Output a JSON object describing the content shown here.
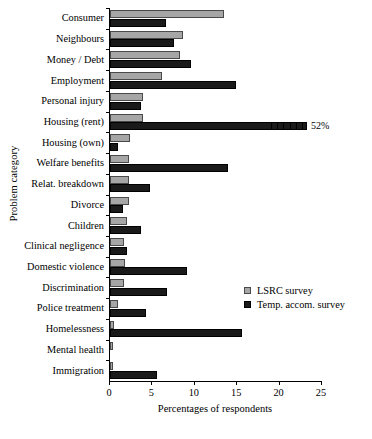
{
  "chart_data": {
    "type": "bar",
    "orientation": "horizontal",
    "title": "",
    "xlabel": "Percentages of respondents",
    "ylabel": "Problem category",
    "xlim": [
      0,
      25
    ],
    "xticks": [
      0,
      5,
      10,
      15,
      20,
      25
    ],
    "xtick_labels": [
      "0",
      "5",
      "10",
      "15",
      "20",
      "25"
    ],
    "grid": false,
    "legend_position": "right-middle",
    "categories": [
      "Consumer",
      "Neighbours",
      "Money / Debt",
      "Employment",
      "Personal injury",
      "Housing (rent)",
      "Housing (own)",
      "Welfare benefits",
      "Relat. breakdown",
      "Divorce",
      "Children",
      "Clinical negligence",
      "Domestic violence",
      "Discrimination",
      "Police treatment",
      "Homelessness",
      "Mental health",
      "Immigration"
    ],
    "series": [
      {
        "name": "LSRC survey",
        "color": "#a6a6a6",
        "values": [
          13.5,
          8.6,
          8.3,
          6.1,
          3.9,
          3.9,
          2.3,
          2.2,
          2.2,
          2.2,
          2.0,
          1.7,
          1.8,
          1.6,
          0.9,
          0.5,
          0.4,
          0.3
        ]
      },
      {
        "name": "Temp. accom. survey",
        "color": "#1a1a1a",
        "values": [
          6.6,
          7.5,
          9.6,
          14.9,
          3.7,
          52.0,
          1.0,
          13.9,
          4.7,
          1.5,
          3.7,
          2.0,
          9.1,
          6.7,
          4.2,
          15.6,
          0.0,
          5.5
        ]
      }
    ],
    "annotations": [
      {
        "text": "52%",
        "category": "Housing (rent)",
        "series": "Temp. accom. survey",
        "note": "bar truncated with break marks"
      }
    ]
  },
  "legend": {
    "items": [
      {
        "label": "LSRC survey",
        "swatch": "gray-square-icon"
      },
      {
        "label": "Temp. accom. survey",
        "swatch": "black-square-icon"
      }
    ]
  }
}
